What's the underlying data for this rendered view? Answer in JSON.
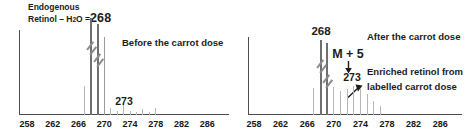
{
  "figure": {
    "width": 469,
    "height": 137,
    "background": "#ffffff",
    "colors": {
      "dark_peak": "#6f6f6f",
      "mid_peak": "#9a9a9a",
      "light_peak": "#b7b7b7",
      "axis": "#4d4d4d",
      "text": "#1c1c1c",
      "break_mark": "#8c8c8c"
    }
  },
  "left_panel": {
    "title_line1": "Endogenous",
    "formula": {
      "prefix": "Retinol – H",
      "sub": "2",
      "suffix": "O =",
      "mass": "268"
    },
    "caption": "Before the carrot dose",
    "minor_peak_label": "273"
  },
  "right_panel": {
    "main_peak_label": "268",
    "caption": "After the carrot dose",
    "m_plus_label": "M + 5",
    "minor_peak_label": "273",
    "note_line1": "Enriched retinol from",
    "note_line2": "labelled carrot dose"
  },
  "chart_data": [
    {
      "type": "bar",
      "title": "Before the carrot dose",
      "xlabel": "",
      "ylabel": "",
      "x_ticks": [
        258,
        262,
        266,
        270,
        274,
        278,
        282,
        286
      ],
      "xlim": [
        256.5,
        289.5
      ],
      "x": [
        267,
        268,
        269,
        270,
        271,
        272,
        273,
        274,
        275,
        276,
        277,
        278
      ],
      "values": [
        0.3,
        1.0,
        0.94,
        0.8,
        0.07,
        0.04,
        0.1,
        0.04,
        0.03,
        0.06,
        0.03,
        0.07
      ],
      "off_scale_break_peaks": [
        268,
        269
      ],
      "mid_tone_peaks": [
        270
      ],
      "annotations": [
        "Endogenous Retinol – H2O =268",
        "Before the carrot dose",
        "273"
      ]
    },
    {
      "type": "bar",
      "title": "After the carrot dose",
      "xlabel": "",
      "ylabel": "",
      "x_ticks": [
        258,
        262,
        266,
        270,
        274,
        278,
        282,
        286
      ],
      "xlim": [
        256.5,
        289.5
      ],
      "x": [
        267,
        268,
        269,
        270,
        271,
        272,
        273,
        274,
        275,
        276,
        277
      ],
      "values": [
        0.36,
        1.0,
        0.96,
        0.37,
        0.32,
        0.35,
        0.39,
        0.36,
        0.28,
        0.19,
        0.12
      ],
      "off_scale_break_peaks": [
        268,
        269
      ],
      "mid_tone_peaks": [],
      "annotations": [
        "268",
        "M + 5",
        "273",
        "After the carrot dose",
        "Enriched retinol from labelled carrot dose"
      ]
    }
  ]
}
